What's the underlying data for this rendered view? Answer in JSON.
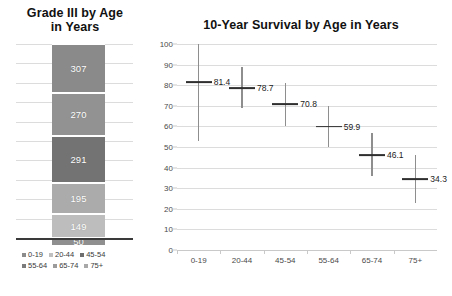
{
  "left": {
    "title": "Grade III by Age in Years",
    "title_line1": "Grade III by Age",
    "title_line2": "in Years",
    "legend": [
      {
        "label": "0-19",
        "color": "#8c8c8c"
      },
      {
        "label": "20-44",
        "color": "#bfbfbf"
      },
      {
        "label": "45-54",
        "color": "#6e6e6e"
      },
      {
        "label": "55-64",
        "color": "#7b7b7b"
      },
      {
        "label": "65-74",
        "color": "#9b9b9b"
      },
      {
        "label": "75+",
        "color": "#a8a8a8"
      }
    ]
  },
  "right": {
    "title": "10-Year Survival by Age in Years"
  },
  "chart_data": [
    {
      "type": "bar",
      "subtype": "stacked-bar-100-percent",
      "title": "Grade III by Age in Years",
      "xlabel": "",
      "ylabel": "",
      "ylim": [
        0,
        100
      ],
      "yticks": [
        0,
        10,
        20,
        30,
        40,
        50,
        60,
        70,
        80,
        90,
        100
      ],
      "grid": true,
      "legend_position": "bottom",
      "categories": [
        "0-19",
        "20-44",
        "45-54",
        "55-64",
        "65-74",
        "75+"
      ],
      "segments": [
        {
          "name": "75+",
          "label": "307",
          "value": 307,
          "percent": 25.3,
          "color": "#8a8a8a",
          "order_from_top": 1
        },
        {
          "name": "65-74",
          "label": "270",
          "value": 270,
          "percent": 22.3,
          "color": "#929292",
          "order_from_top": 2
        },
        {
          "name": "55-64",
          "label": "291",
          "value": 291,
          "percent": 24.0,
          "color": "#737373",
          "order_from_top": 3
        },
        {
          "name": "45-54",
          "label": "195",
          "value": 195,
          "percent": 16.1,
          "color": "#ababab",
          "order_from_top": 4
        },
        {
          "name": "20-44",
          "label": "149",
          "value": 149,
          "percent": 12.3,
          "color": "#bdbdbd",
          "order_from_top": 5
        },
        {
          "name": "0-19",
          "label": "50",
          "value": 50,
          "percent": 4.1,
          "color": "#8f8f8f",
          "order_from_top": 6
        }
      ]
    },
    {
      "type": "scatter",
      "subtype": "point-with-error-bars",
      "title": "10-Year Survival by Age in Years",
      "xlabel": "",
      "ylabel": "",
      "ylim": [
        0,
        100
      ],
      "yticks": [
        0,
        10,
        20,
        30,
        40,
        50,
        60,
        70,
        80,
        90,
        100
      ],
      "grid": true,
      "categories": [
        "0-19",
        "20-44",
        "45-54",
        "55-64",
        "65-74",
        "75+"
      ],
      "series": [
        {
          "name": "10-Year Survival",
          "values": [
            81.4,
            78.7,
            70.8,
            59.9,
            46.1,
            34.3
          ],
          "labels": [
            "81.4",
            "78.7",
            "70.8",
            "59.9",
            "46.1",
            "34.3"
          ],
          "error_low": [
            53.0,
            69.0,
            60.0,
            50.0,
            36.0,
            23.0
          ],
          "error_high": [
            100.0,
            89.0,
            81.0,
            70.0,
            57.0,
            46.0
          ]
        }
      ]
    }
  ]
}
